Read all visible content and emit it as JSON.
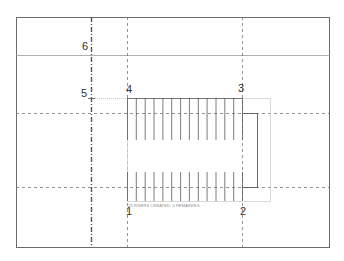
{
  "view": {
    "type": "stair-sketch-plan",
    "frame_color": "#6b6b6b",
    "line_color": "#5a5a5a",
    "boundary_color": "#cfcfcf"
  },
  "grid_points": [
    {
      "id": "1",
      "label": "1"
    },
    {
      "id": "2",
      "label": "2"
    },
    {
      "id": "3",
      "label": "3"
    },
    {
      "id": "4",
      "label": "4"
    },
    {
      "id": "5",
      "label": "5"
    },
    {
      "id": "6",
      "label": "6"
    }
  ],
  "stair": {
    "top_run_treads": 13,
    "bottom_run_treads": 13,
    "status_hint": "23 RISERS CREATED, 0 REMAINING"
  }
}
